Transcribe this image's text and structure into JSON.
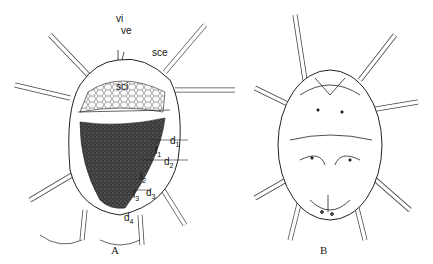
{
  "figure": {
    "panels": [
      {
        "id": "A",
        "label": "A",
        "view": "dorsal"
      },
      {
        "id": "B",
        "label": "B",
        "view": "ventral"
      }
    ],
    "setae_labels": {
      "vi": "vi",
      "ve": "ve",
      "sce": "sce",
      "sci": "sci",
      "d1": "d",
      "d1_sub": "1",
      "l1": "l",
      "l1_sub": "1",
      "d2": "d",
      "d2_sub": "2",
      "l2": "l",
      "l2_sub": "2",
      "d3": "d",
      "d3_sub": "3",
      "l3": "l",
      "l3_sub": "3",
      "d4": "d",
      "d4_sub": "4"
    },
    "colors": {
      "line": "#222222",
      "shield_dark": "#2a2a2a",
      "background": "#ffffff"
    }
  }
}
